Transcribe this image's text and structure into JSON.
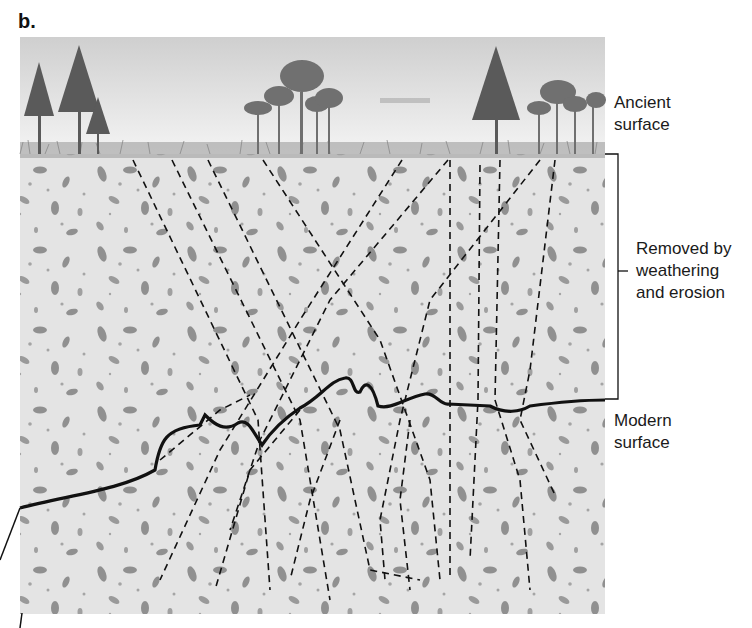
{
  "figure": {
    "panel_label": "b.",
    "labels": {
      "ancient_surface": [
        "Ancient",
        "surface"
      ],
      "removed": [
        "Removed by",
        "weathering",
        "and erosion"
      ],
      "modern_surface": [
        "Modern",
        "surface"
      ]
    },
    "colors": {
      "sky_top": "#cfcfcf",
      "sky_bottom": "#f2f2f2",
      "soil": "#e4e4e4",
      "clast": "#8f8f8f",
      "tree": "#5a5a5a",
      "grass": "#9a9a9a",
      "line": "#111111"
    }
  }
}
